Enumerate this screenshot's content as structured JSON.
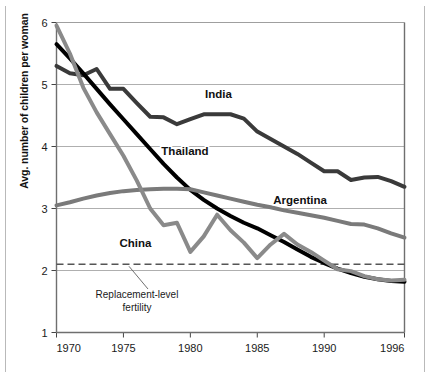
{
  "chart_data": {
    "type": "line",
    "title": "",
    "subtitle": "",
    "xlabel": "",
    "ylabel": "Avg. number of children per woman",
    "xlim": [
      1970,
      1996
    ],
    "ylim": [
      1,
      6
    ],
    "yticks": [
      1,
      2,
      3,
      4,
      5,
      6
    ],
    "ytick_labels": [
      "1",
      "2",
      "3",
      "4",
      "5",
      "6"
    ],
    "xticks": [
      1970,
      1975,
      1980,
      1985,
      1990,
      1996
    ],
    "xtick_labels": [
      "1970",
      "1975",
      "1980",
      "1985",
      "1990",
      "1996"
    ],
    "grid": "horizontal",
    "legend_position": "inline-labels",
    "annotations": [
      {
        "name": "replacement-level-fertility",
        "text_line_1": "Replacement-level",
        "text_line_2": "fertility",
        "value": 2.1,
        "style": "dashed-horizontal-line",
        "color": "#555555"
      }
    ],
    "x": [
      1970,
      1971,
      1972,
      1973,
      1974,
      1975,
      1976,
      1977,
      1978,
      1979,
      1980,
      1981,
      1982,
      1983,
      1984,
      1985,
      1986,
      1987,
      1988,
      1989,
      1990,
      1991,
      1992,
      1993,
      1994,
      1995,
      1996
    ],
    "series": [
      {
        "name": "India",
        "label": "India",
        "color": "#3a3a3a",
        "width": 4,
        "label_x": 1982.1,
        "label_y": 4.78,
        "values": [
          5.3,
          5.18,
          5.15,
          5.25,
          4.93,
          4.93,
          4.7,
          4.48,
          4.47,
          4.36,
          4.44,
          4.52,
          4.52,
          4.52,
          4.45,
          4.24,
          4.12,
          4.0,
          3.88,
          3.74,
          3.6,
          3.6,
          3.46,
          3.5,
          3.51,
          3.44,
          3.35
        ]
      },
      {
        "name": "Thailand",
        "label": "Thailand",
        "color": "#000000",
        "width": 4,
        "label_x": 1979.6,
        "label_y": 3.86,
        "values": [
          5.65,
          5.42,
          5.18,
          4.93,
          4.68,
          4.44,
          4.2,
          3.96,
          3.72,
          3.5,
          3.3,
          3.14,
          3.0,
          2.88,
          2.77,
          2.68,
          2.57,
          2.46,
          2.34,
          2.22,
          2.12,
          2.03,
          1.96,
          1.9,
          1.86,
          1.83,
          1.82
        ]
      },
      {
        "name": "Argentina",
        "label": "Argentina",
        "color": "#7a7a7a",
        "width": 4,
        "label_x": 1988.2,
        "label_y": 3.07,
        "values": [
          3.05,
          3.1,
          3.16,
          3.21,
          3.25,
          3.28,
          3.3,
          3.31,
          3.32,
          3.32,
          3.31,
          3.26,
          3.21,
          3.16,
          3.11,
          3.06,
          3.02,
          2.97,
          2.93,
          2.89,
          2.85,
          2.8,
          2.75,
          2.74,
          2.68,
          2.6,
          2.53
        ]
      },
      {
        "name": "China",
        "label": "China",
        "color": "#8a8a8a",
        "width": 4,
        "label_x": 1975.9,
        "label_y": 2.38,
        "values": [
          5.95,
          5.5,
          4.95,
          4.55,
          4.2,
          3.85,
          3.45,
          3.0,
          2.73,
          2.77,
          2.3,
          2.55,
          2.9,
          2.65,
          2.45,
          2.2,
          2.42,
          2.59,
          2.42,
          2.3,
          2.16,
          2.02,
          1.99,
          1.91,
          1.86,
          1.84,
          1.85
        ]
      }
    ]
  },
  "axis": {
    "y_axis_title": "Avg. number of children per woman"
  }
}
